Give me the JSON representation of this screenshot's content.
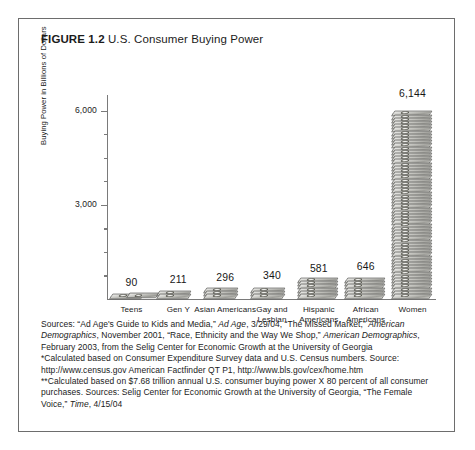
{
  "figure": {
    "label": "FIGURE 1.2",
    "caption": "U.S. Consumer Buying Power"
  },
  "chart_data": {
    "type": "bar",
    "title": "U.S. Consumer Buying Power",
    "xlabel": "",
    "ylabel": "Buying Power in Billions of Dollars",
    "categories": [
      "Teens",
      "Gen Y",
      "Asian Americans",
      "Gay and Lesbian",
      "Hispanic Americans",
      "African Americans",
      "Women"
    ],
    "values": [
      90,
      211,
      296,
      340,
      581,
      646,
      6144
    ],
    "value_labels": [
      "90",
      "211",
      "296",
      "340",
      "581",
      "646",
      "6,144"
    ],
    "ylim": [
      0,
      6500
    ],
    "yticks": [
      3000,
      6000
    ],
    "ytick_labels": [
      "3,000",
      "6,000"
    ],
    "grid": false,
    "legend": false,
    "marker_style": "stacked-money-bills pictograph"
  },
  "sources": {
    "line1_a": "Sources: “Ad Age's Guide to Kids and Media,” ",
    "line1_i1": "Ad Age",
    "line1_b": ", 3/29/04, “The Missed Market,” ",
    "line1_i2": "American Demographics",
    "line1_c": ", November 2001, “Race, Ethnicity and the Way We Shop,” ",
    "line1_i3": "American Demographics",
    "line1_d": ", February 2003, from the Selig Center for Economic Growth at the University of Georgia",
    "line2": "*Calculated based on Consumer Expenditure Survey data and U.S. Census numbers. Source: http://www.census.gov American Factfinder QT P1, http://www.bls.gov/cex/home.htm",
    "line3_a": "**Calculated based on $7.68 trillion annual U.S. consumer buying power X 80 percent of all consumer purchases. Sources: Selig Center for Economic Growth at the University of Georgia, “The Female Voice,” ",
    "line3_i1": "Time",
    "line3_b": ", 4/15/04"
  }
}
